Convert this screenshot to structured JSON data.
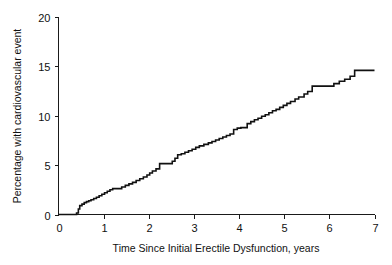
{
  "chart_data": {
    "type": "line",
    "subtype": "kaplan-meier-cumulative-incidence",
    "title": "",
    "xlabel": "Time Since Initial Erectile Dysfunction, years",
    "ylabel": "Percentage with cardiovascular event",
    "xlim": [
      0,
      7
    ],
    "ylim": [
      0,
      20
    ],
    "grid": false,
    "legend": false,
    "xticks": [
      0,
      1,
      2,
      3,
      4,
      5,
      6,
      7
    ],
    "xtick_labels": [
      "0",
      "1",
      "2",
      "3",
      "4",
      "5",
      "6",
      "7"
    ],
    "yticks": [
      0,
      5,
      10,
      15,
      20
    ],
    "ytick_labels": [
      "0",
      "5",
      "10",
      "15",
      "20"
    ],
    "series": [
      {
        "name": "Cumulative cardiovascular event incidence",
        "color": "#111111",
        "step": "post",
        "x": [
          0.0,
          0.33,
          0.4,
          0.44,
          0.47,
          0.52,
          0.57,
          0.62,
          0.67,
          0.72,
          0.78,
          0.84,
          0.9,
          0.96,
          1.02,
          1.08,
          1.14,
          1.2,
          1.26,
          1.32,
          1.4,
          1.48,
          1.56,
          1.64,
          1.72,
          1.8,
          1.88,
          1.96,
          2.02,
          2.08,
          2.16,
          2.24,
          2.44,
          2.52,
          2.58,
          2.64,
          2.72,
          2.8,
          2.88,
          2.96,
          3.04,
          3.12,
          3.22,
          3.32,
          3.4,
          3.48,
          3.56,
          3.64,
          3.72,
          3.8,
          3.88,
          3.96,
          4.04,
          4.18,
          4.26,
          4.34,
          4.42,
          4.5,
          4.58,
          4.66,
          4.74,
          4.82,
          4.9,
          4.98,
          5.06,
          5.14,
          5.24,
          5.32,
          5.44,
          5.52,
          5.62,
          5.98,
          6.1,
          6.22,
          6.34,
          6.46,
          6.56,
          7.0
        ],
        "y": [
          0.0,
          0.0,
          0.15,
          0.55,
          0.9,
          1.05,
          1.2,
          1.3,
          1.4,
          1.5,
          1.62,
          1.75,
          1.9,
          2.05,
          2.2,
          2.35,
          2.5,
          2.62,
          2.62,
          2.62,
          2.78,
          2.95,
          3.1,
          3.25,
          3.45,
          3.62,
          3.8,
          4.0,
          4.2,
          4.4,
          4.62,
          5.15,
          5.15,
          5.4,
          5.7,
          6.05,
          6.15,
          6.3,
          6.45,
          6.6,
          6.8,
          6.95,
          7.1,
          7.25,
          7.4,
          7.55,
          7.7,
          7.85,
          8.0,
          8.15,
          8.6,
          8.75,
          8.8,
          9.2,
          9.4,
          9.6,
          9.75,
          9.95,
          10.1,
          10.3,
          10.5,
          10.65,
          10.85,
          11.05,
          11.25,
          11.45,
          11.7,
          11.9,
          12.2,
          12.45,
          13.0,
          13.0,
          13.25,
          13.5,
          13.7,
          14.0,
          14.6,
          14.6
        ],
        "final_value": 14.6
      }
    ],
    "annotations": []
  },
  "axis": {
    "x_title": "Time Since Initial Erectile Dysfunction, years",
    "y_title": "Percentage with cardiovascular event",
    "x_tick_labels": [
      "0",
      "1",
      "2",
      "3",
      "4",
      "5",
      "6",
      "7"
    ],
    "y_tick_labels": [
      "0",
      "5",
      "10",
      "15",
      "20"
    ]
  }
}
